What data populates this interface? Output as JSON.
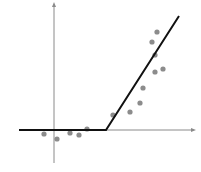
{
  "diagram": {
    "type": "relu-fit-scatter",
    "colors": {
      "axis": "#8a8a8a",
      "fit_line": "#111111",
      "points": "#8c8c8c",
      "background": "#ffffff"
    },
    "axes": {
      "origin": [
        55,
        130
      ],
      "x_axis": {
        "x1": 19,
        "x2": 193,
        "y": 130
      },
      "y_axis": {
        "x": 54,
        "y1": 5,
        "y2": 163
      }
    },
    "fit_line": {
      "points": [
        [
          19,
          130
        ],
        [
          106,
          130
        ],
        [
          179,
          16
        ]
      ]
    },
    "data_points": [
      [
        44,
        134
      ],
      [
        57,
        139
      ],
      [
        70,
        133
      ],
      [
        79,
        135
      ],
      [
        87,
        129
      ],
      [
        113,
        115
      ],
      [
        130,
        112
      ],
      [
        140,
        103
      ],
      [
        143,
        88
      ],
      [
        155,
        72
      ],
      [
        163,
        69
      ],
      [
        155,
        55
      ],
      [
        152,
        42
      ],
      [
        157,
        32
      ]
    ]
  }
}
